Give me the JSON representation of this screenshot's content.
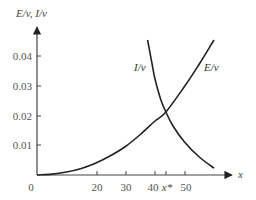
{
  "chart_data": {
    "type": "line",
    "title": "",
    "xlabel": "x",
    "ylabel": "E/v, I/v",
    "xlim": [
      0,
      65
    ],
    "ylim": [
      0,
      0.05
    ],
    "grid": false,
    "legend": "inline curve labels",
    "x_ticks": [
      {
        "value": 0,
        "label": "0"
      },
      {
        "value": 20,
        "label": "20"
      },
      {
        "value": 30,
        "label": "30"
      },
      {
        "value": 40,
        "label": "40"
      },
      {
        "value": 43.7,
        "label": "x*"
      },
      {
        "value": 50,
        "label": "50"
      }
    ],
    "y_ticks": [
      {
        "value": 0.01,
        "label": "0.01"
      },
      {
        "value": 0.02,
        "label": "0.02"
      },
      {
        "value": 0.03,
        "label": "0.03"
      },
      {
        "value": 0.04,
        "label": "0.04"
      }
    ],
    "series": [
      {
        "name": "E/v",
        "label": "E/v",
        "x": [
          0,
          5,
          10,
          15,
          20,
          25,
          30,
          35,
          40,
          43.7,
          50,
          55,
          60
        ],
        "y": [
          0,
          0.0003,
          0.001,
          0.0022,
          0.004,
          0.0065,
          0.0095,
          0.0135,
          0.018,
          0.021,
          0.0295,
          0.037,
          0.045
        ]
      },
      {
        "name": "I/v",
        "label": "I/v",
        "x": [
          37.5,
          39,
          40,
          42,
          43.7,
          46,
          50,
          55,
          60
        ],
        "y": [
          0.045,
          0.037,
          0.032,
          0.025,
          0.021,
          0.0165,
          0.011,
          0.006,
          0.0023
        ]
      }
    ],
    "annotations": [
      {
        "text": "x*",
        "description": "x-coordinate of intersection of E/v and I/v",
        "x": 43.7,
        "y": 0.021
      }
    ]
  }
}
